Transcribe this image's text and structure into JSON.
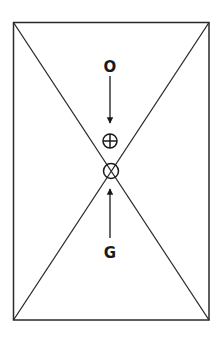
{
  "diagram": {
    "title": "",
    "frame": {
      "x1": 13,
      "y1": 22,
      "x2": 209,
      "y2": 320,
      "stroke": "#2a2a2a"
    },
    "labels": {
      "top": "O",
      "bottom": "G"
    },
    "symbols": {
      "upper": "circle-plus",
      "lower": "circle-cross"
    },
    "arrows": [
      {
        "from": "O",
        "direction": "down",
        "target": "circle-plus"
      },
      {
        "from": "G",
        "direction": "up",
        "target": "circle-cross"
      }
    ]
  }
}
